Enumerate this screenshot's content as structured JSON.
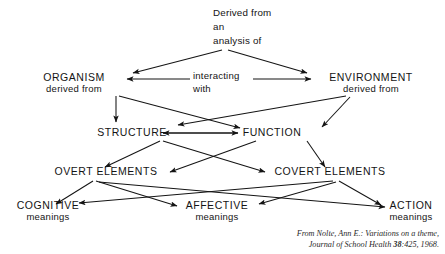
{
  "diagram": {
    "title_caption": {
      "line1": "Derived from",
      "line2": "an",
      "line3": "analysis of"
    },
    "middle_label": {
      "line1": "interacting",
      "line2": "with"
    },
    "nodes": [
      {
        "id": "organism",
        "label": "ORGANISM",
        "sublabel": "derived from"
      },
      {
        "id": "environment",
        "label": "ENVIRONMENT",
        "sublabel": "derived from"
      },
      {
        "id": "structure",
        "label": "STRUCTURE",
        "sublabel": ""
      },
      {
        "id": "function",
        "label": "FUNCTION",
        "sublabel": ""
      },
      {
        "id": "overt",
        "label": "OVERT ELEMENTS",
        "sublabel": ""
      },
      {
        "id": "covert",
        "label": "COVERT ELEMENTS",
        "sublabel": ""
      },
      {
        "id": "cognitive",
        "label": "COGNITIVE",
        "sublabel": "meanings"
      },
      {
        "id": "affective",
        "label": "AFFECTIVE",
        "sublabel": "meanings"
      },
      {
        "id": "action",
        "label": "ACTION",
        "sublabel": "meanings"
      }
    ],
    "citation": {
      "line1": "From Nolte, Ann E.: Variations on a theme,",
      "line2_prefix": "Journal of School Health ",
      "line2_volume": "38",
      "line2_suffix": ":425, 1968."
    },
    "colors": {
      "background": "#ffffff",
      "ink": "#141414",
      "citation_ink": "#2a2a2a"
    }
  }
}
